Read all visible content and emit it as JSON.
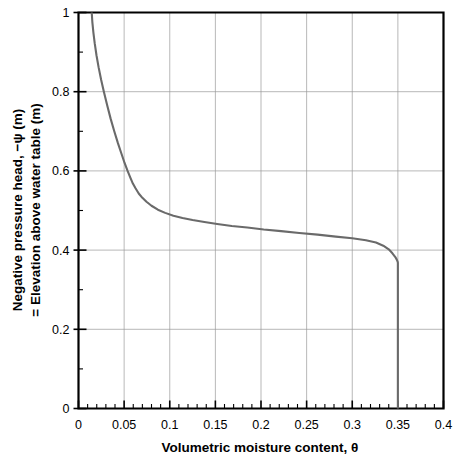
{
  "chart_data": {
    "type": "line",
    "title": "",
    "xlabel": "Volumetric moisture content, θ",
    "ylabel_line1": "Negative pressure head, −ψ (m)",
    "ylabel_line2": "= Elevation above water table (m)",
    "xlim": [
      0,
      0.4
    ],
    "ylim": [
      0,
      1
    ],
    "xticks": [
      0,
      0.05,
      0.1,
      0.15,
      0.2,
      0.25,
      0.3,
      0.35,
      0.4
    ],
    "xtick_labels": [
      "0",
      "0.05",
      "0.1",
      "0.15",
      "0.2",
      "0.25",
      "0.3",
      "0.35",
      "0.4"
    ],
    "yticks": [
      0,
      0.2,
      0.4,
      0.6,
      0.8,
      1
    ],
    "ytick_labels": [
      "0",
      "0.2",
      "0.4",
      "0.6",
      "0.8",
      "1"
    ],
    "x_minor_step": 0.01,
    "y_minor_step": 0.1,
    "grid": true,
    "grid_x_step": 0.05,
    "grid_y_step": 0.2,
    "legend": "none",
    "series": [
      {
        "name": "Soil moisture retention curve",
        "color": "#6a6a6a",
        "x": [
          0.0145,
          0.0152,
          0.0163,
          0.0178,
          0.0197,
          0.022,
          0.0248,
          0.028,
          0.0315,
          0.0352,
          0.0392,
          0.0432,
          0.047,
          0.0505,
          0.0538,
          0.0568,
          0.0596,
          0.0625,
          0.066,
          0.07,
          0.0745,
          0.08,
          0.087,
          0.095,
          0.104,
          0.114,
          0.125,
          0.138,
          0.152,
          0.168,
          0.185,
          0.203,
          0.222,
          0.242,
          0.262,
          0.282,
          0.3,
          0.315,
          0.326,
          0.334,
          0.34,
          0.344,
          0.347,
          0.3488,
          0.3497,
          0.35,
          0.35,
          0.35,
          0.35,
          0.35
        ],
        "y": [
          1.0,
          0.975,
          0.95,
          0.922,
          0.892,
          0.862,
          0.83,
          0.798,
          0.765,
          0.732,
          0.7,
          0.67,
          0.644,
          0.62,
          0.6,
          0.583,
          0.568,
          0.556,
          0.543,
          0.532,
          0.522,
          0.512,
          0.502,
          0.494,
          0.487,
          0.481,
          0.476,
          0.471,
          0.466,
          0.461,
          0.457,
          0.452,
          0.448,
          0.443,
          0.439,
          0.434,
          0.43,
          0.425,
          0.419,
          0.411,
          0.402,
          0.392,
          0.383,
          0.376,
          0.371,
          0.368,
          0.25,
          0.12,
          0.04,
          0.0
        ]
      }
    ]
  }
}
